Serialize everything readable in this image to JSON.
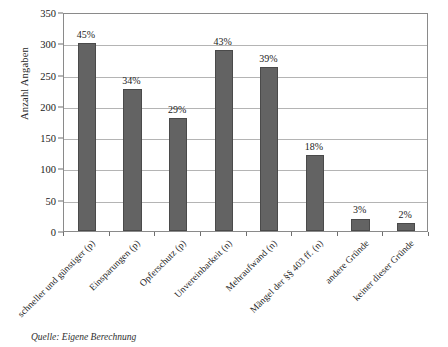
{
  "chart_data": {
    "type": "bar",
    "title": "",
    "xlabel": "",
    "ylabel": "Anzahl Angaben",
    "ylim": [
      0,
      350
    ],
    "yticks": [
      0,
      50,
      100,
      150,
      200,
      250,
      300,
      350
    ],
    "grid": true,
    "legend": null,
    "categories": [
      "schneller und günstiger (p)",
      "Einsparungen (p)",
      "Opferschutz (p)",
      "Unvereinbarkeit (n)",
      "Mehraufwand (n)",
      "Mängel der §§ 403 ff. (n)",
      "andere Gründe",
      "keiner dieser Gründe"
    ],
    "values": [
      301,
      227,
      180,
      290,
      262,
      121,
      20,
      13
    ],
    "data_labels": [
      "45%",
      "34%",
      "29%",
      "43%",
      "39%",
      "18%",
      "3%",
      "2%"
    ],
    "bar_color": "#636363",
    "bar_edge_color": "#4a4a4a",
    "gridline_color": "#b4b4b4",
    "axis_color": "#8a8a8a"
  },
  "source_note": "Quelle: Eigene Berechnung"
}
